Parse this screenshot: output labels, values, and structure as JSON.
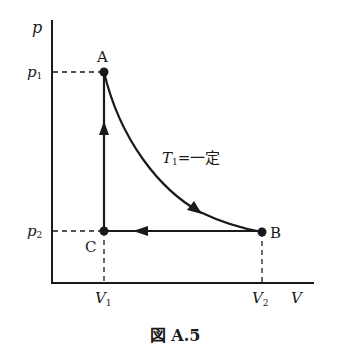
{
  "figure": {
    "caption": "図 A.5"
  },
  "axes": {
    "y_label": "p",
    "x_label": "V",
    "y_ticks": [
      {
        "label": "p",
        "sub": "1"
      },
      {
        "label": "p",
        "sub": "2"
      }
    ],
    "x_ticks": [
      {
        "label": "V",
        "sub": "1"
      },
      {
        "label": "V",
        "sub": "2"
      }
    ]
  },
  "points": [
    {
      "name": "A",
      "V": "V1",
      "p": "p1"
    },
    {
      "name": "B",
      "V": "V2",
      "p": "p2"
    },
    {
      "name": "C",
      "V": "V1",
      "p": "p2"
    }
  ],
  "processes": [
    {
      "from": "A",
      "to": "B",
      "type": "isothermal curve",
      "label_T": "T",
      "label_sub": "1",
      "label_rest": "=一定"
    },
    {
      "from": "B",
      "to": "C",
      "type": "isobaric (horizontal)"
    },
    {
      "from": "C",
      "to": "A",
      "type": "isochoric (vertical)"
    }
  ],
  "colors": {
    "ink": "#1a1a1a",
    "background": "#ffffff"
  }
}
